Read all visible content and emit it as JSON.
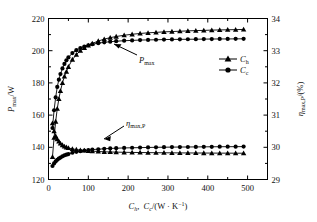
{
  "chart_data": {
    "type": "line",
    "title": "",
    "xlabel": "C_h, C_c/(W·K⁻¹)",
    "xlabel_parts": {
      "c1": "C",
      "c1_sub": "h",
      "comma": ",",
      "c2": "C",
      "c2_sub": "c",
      "unit": "/(W · K",
      "unit_sup": "−1",
      "unit_close": ")"
    },
    "ylabel_left": "P_max/W",
    "ylabel_left_parts": {
      "sym": "P",
      "sub": "max",
      "unit": "/W"
    },
    "ylabel_right": "η_max,P/(%)",
    "ylabel_right_parts": {
      "sym": "η",
      "sub": "max,P",
      "unit": "/(%)"
    },
    "xlim": [
      0,
      550
    ],
    "xticks": [
      0,
      100,
      200,
      300,
      400,
      500
    ],
    "xticklabels": [
      "0",
      "100",
      "200",
      "300",
      "400",
      "500"
    ],
    "ylim_left": [
      120,
      220
    ],
    "yticks_left": [
      120,
      140,
      160,
      180,
      200,
      220
    ],
    "yticklabels_left": [
      "120",
      "140",
      "160",
      "180",
      "200",
      "220"
    ],
    "ylim_right": [
      29,
      34
    ],
    "yticks_right": [
      29,
      30,
      31,
      32,
      33,
      34
    ],
    "yticklabels_right": [
      "29",
      "30",
      "31",
      "32",
      "33",
      "34"
    ],
    "grid": false,
    "legend_position": "center-right",
    "legend": [
      {
        "label": "C",
        "sub": "h",
        "marker": "triangle"
      },
      {
        "label": "C",
        "sub": "c",
        "marker": "circle"
      }
    ],
    "annotations": [
      {
        "text": "P",
        "sub": "max",
        "kind": "power-curve-annotation"
      },
      {
        "text": "η",
        "sub": "max,P",
        "kind": "efficiency-curve-annotation"
      }
    ],
    "series": [
      {
        "name": "P_max vs C_h",
        "axis": "left",
        "marker": "triangle",
        "x": [
          10,
          14,
          18,
          22,
          26,
          30,
          35,
          40,
          45,
          50,
          60,
          70,
          80,
          90,
          100,
          110,
          125,
          140,
          155,
          170,
          190,
          210,
          230,
          250,
          270,
          290,
          310,
          330,
          350,
          370,
          390,
          410,
          430,
          450,
          470,
          490
        ],
        "y": [
          134,
          146,
          156,
          164,
          170,
          175,
          180,
          184,
          187,
          190,
          194.5,
          197.5,
          200,
          201.8,
          203.3,
          204.5,
          206,
          207.2,
          208.1,
          208.8,
          209.6,
          210.2,
          210.7,
          211.1,
          211.4,
          211.7,
          211.9,
          212.1,
          212.3,
          212.5,
          212.6,
          212.8,
          212.9,
          213,
          213.1,
          213.2
        ]
      },
      {
        "name": "P_max vs C_c",
        "axis": "left",
        "marker": "circle",
        "x": [
          10,
          14,
          18,
          22,
          26,
          30,
          35,
          40,
          45,
          50,
          60,
          70,
          80,
          90,
          100,
          110,
          125,
          140,
          155,
          170,
          190,
          210,
          230,
          250,
          270,
          290,
          310,
          330,
          350,
          370,
          390,
          410,
          430,
          450,
          470,
          490
        ],
        "y": [
          152,
          163,
          171,
          177.5,
          182,
          185.5,
          189,
          191.8,
          194,
          195.8,
          198.5,
          200.3,
          201.6,
          202.6,
          203.4,
          204,
          204.7,
          205.2,
          205.6,
          205.9,
          206.2,
          206.4,
          206.6,
          206.7,
          206.8,
          206.9,
          207,
          207.05,
          207.1,
          207.15,
          207.2,
          207.25,
          207.3,
          207.3,
          207.35,
          207.4
        ]
      },
      {
        "name": "η_max,P vs C_h",
        "axis": "right",
        "marker": "triangle",
        "x": [
          10,
          14,
          18,
          22,
          26,
          30,
          35,
          40,
          45,
          50,
          60,
          70,
          80,
          90,
          100,
          110,
          125,
          140,
          155,
          170,
          190,
          210,
          230,
          250,
          270,
          290,
          310,
          330,
          350,
          370,
          390,
          410,
          430,
          450,
          470,
          490
        ],
        "y": [
          30.75,
          30.5,
          30.35,
          30.25,
          30.18,
          30.12,
          30.07,
          30.03,
          30.0,
          29.98,
          29.95,
          29.93,
          29.91,
          29.9,
          29.89,
          29.88,
          29.87,
          29.86,
          29.855,
          29.85,
          29.845,
          29.84,
          29.838,
          29.835,
          29.832,
          29.83,
          29.828,
          29.826,
          29.825,
          29.823,
          29.822,
          29.82,
          29.819,
          29.818,
          29.817,
          29.816
        ]
      },
      {
        "name": "η_max,P vs C_c",
        "axis": "right",
        "marker": "circle",
        "x": [
          10,
          14,
          18,
          22,
          26,
          30,
          35,
          40,
          45,
          50,
          60,
          70,
          80,
          90,
          100,
          110,
          125,
          140,
          155,
          170,
          190,
          210,
          230,
          250,
          270,
          290,
          310,
          330,
          350,
          370,
          390,
          410,
          430,
          450,
          470,
          490
        ],
        "y": [
          29.42,
          29.5,
          29.56,
          29.61,
          29.65,
          29.68,
          29.72,
          29.75,
          29.77,
          29.79,
          29.83,
          29.86,
          29.88,
          29.9,
          29.91,
          29.93,
          29.94,
          29.955,
          29.965,
          29.972,
          29.98,
          29.986,
          29.99,
          29.995,
          30.0,
          30.003,
          30.006,
          30.008,
          30.01,
          30.012,
          30.014,
          30.016,
          30.018,
          30.019,
          30.02,
          30.021
        ]
      }
    ]
  },
  "colors": {
    "line": "#000000",
    "background": "#ffffff",
    "text": "#111111"
  }
}
